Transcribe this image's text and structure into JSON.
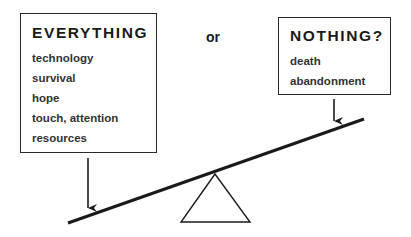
{
  "left_box": {
    "title": "EVERYTHING",
    "items": [
      "technology",
      "survival",
      "hope",
      "touch, attention",
      "resources"
    ]
  },
  "connector": "or",
  "right_box": {
    "title": "NOTHING?",
    "items": [
      "death",
      "abandonment"
    ]
  },
  "seesaw": {
    "beam": {
      "x1": 68,
      "y1": 223,
      "x2": 364,
      "y2": 119
    },
    "fulcrum": {
      "apex": [
        215,
        174
      ],
      "base_left": [
        181,
        222
      ],
      "base_right": [
        250,
        222
      ]
    },
    "heavier_side": "left"
  },
  "colors": {
    "line": "#1a1a1a",
    "background": "#ffffff"
  }
}
